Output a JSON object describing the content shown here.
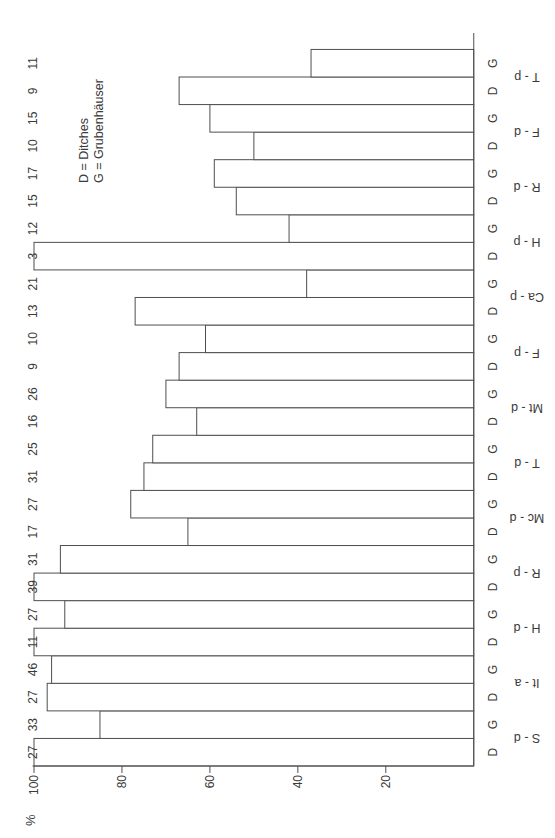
{
  "chart_data": {
    "type": "bar",
    "title": "",
    "ylabel": "%",
    "ylim": [
      0,
      100
    ],
    "yticks": [
      20,
      40,
      60,
      80,
      100
    ],
    "grid": false,
    "legend": [
      "D = Ditches",
      "G = Grubenhäuser"
    ],
    "legend_position": "top-right",
    "bar_group_labels": [
      "D",
      "G"
    ],
    "categories": [
      "S - d",
      "It - a",
      "H - d",
      "R - p",
      "Mc - d",
      "T - d",
      "Mt - d",
      "F - p",
      "Ca - p",
      "H - p",
      "R - d",
      "F - d",
      "T - p"
    ],
    "series": [
      {
        "name": "D",
        "values": [
          100,
          97,
          100,
          100,
          65,
          75,
          63,
          67,
          77,
          100,
          54,
          50,
          67
        ],
        "sample_sizes": [
          27,
          27,
          11,
          39,
          17,
          31,
          16,
          9,
          13,
          3,
          15,
          10,
          9
        ]
      },
      {
        "name": "G",
        "values": [
          85,
          96,
          93,
          94,
          78,
          73,
          70,
          61,
          38,
          42,
          59,
          60,
          37
        ],
        "sample_sizes": [
          33,
          46,
          27,
          31,
          27,
          25,
          26,
          10,
          21,
          12,
          17,
          15,
          11
        ]
      }
    ],
    "layout_hints": {
      "page_rotation": "chart rotated 90deg counterclockwise on page",
      "bars_contiguous": true,
      "category_label_rotation": "vertical (reads bottom-to-top in chart orientation)",
      "colors": {
        "background": "#ffffff",
        "line": "#4f4f4f",
        "text": "#3a3a3a",
        "bar_fill": "#ffffff"
      }
    }
  }
}
